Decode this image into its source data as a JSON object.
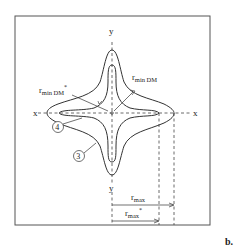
{
  "figure": {
    "panel_label": "b.",
    "axes": {
      "x_left": "x",
      "x_right": "x",
      "y_top": "y",
      "y_bottom": "y"
    },
    "curves": [
      {
        "id": "3",
        "label": "3",
        "description": "outer four-lobed contour"
      },
      {
        "id": "4",
        "label": "4",
        "description": "inner four-lobed contour"
      }
    ],
    "annotations": {
      "r_min_dm_star": {
        "base": "r",
        "sub": "min DM",
        "sup": "*"
      },
      "r_min_dm": {
        "base": "r",
        "sub": "min DM"
      },
      "r_max": {
        "base": "r",
        "sub": "max"
      },
      "r_max_star": {
        "base": "r",
        "sub": "max",
        "sup": "*"
      }
    },
    "colors": {
      "line": "#333333",
      "border": "#555555",
      "background": "#ffffff"
    }
  }
}
